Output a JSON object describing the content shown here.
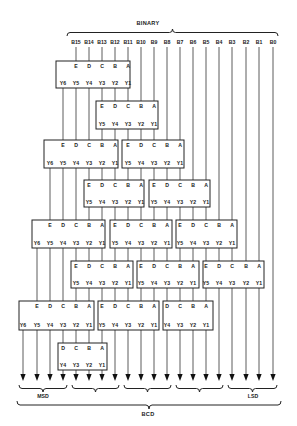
{
  "title": "BINARY",
  "bottom_title": "BCD",
  "msd_label": "MSD",
  "lsd_label": "LSD",
  "columns": [
    23,
    37,
    50,
    63,
    76,
    89,
    102,
    115,
    128,
    141,
    154,
    167,
    180,
    193,
    206,
    219,
    232,
    246,
    259,
    273
  ],
  "binary_bits": [
    {
      "label": "B15",
      "col": 4
    },
    {
      "label": "B14",
      "col": 5
    },
    {
      "label": "B13",
      "col": 6
    },
    {
      "label": "B12",
      "col": 7
    },
    {
      "label": "B11",
      "col": 8
    },
    {
      "label": "B10",
      "col": 9
    },
    {
      "label": "B9",
      "col": 10
    },
    {
      "label": "B8",
      "col": 11
    },
    {
      "label": "B7",
      "col": 12
    },
    {
      "label": "B6",
      "col": 13
    },
    {
      "label": "B5",
      "col": 14
    },
    {
      "label": "B4",
      "col": 15
    },
    {
      "label": "B3",
      "col": 16
    },
    {
      "label": "B2",
      "col": 17
    },
    {
      "label": "B1",
      "col": 18
    },
    {
      "label": "B0",
      "col": 19
    }
  ],
  "boxes": [
    {
      "id": "b1",
      "x": 56,
      "y": 61,
      "w": 74,
      "h": 27,
      "inputs": [
        "E",
        "D",
        "C",
        "B",
        "A"
      ],
      "in_col": 4,
      "outputs": [
        "Y6",
        "Y5",
        "Y4",
        "Y3",
        "Y2",
        "Y1"
      ],
      "out_col": 3
    },
    {
      "id": "b2",
      "x": 96,
      "y": 101,
      "w": 62,
      "h": 28,
      "inputs": [
        "E",
        "D",
        "C",
        "B",
        "A"
      ],
      "in_col": 6,
      "outputs": [
        "Y5",
        "Y4",
        "Y3",
        "Y2",
        "Y1"
      ],
      "out_col": 6
    },
    {
      "id": "b3",
      "x": 44,
      "y": 140,
      "w": 74,
      "h": 28,
      "inputs": [
        "E",
        "D",
        "C",
        "B",
        "A"
      ],
      "in_col": 3,
      "outputs": [
        "Y6",
        "Y5",
        "Y4",
        "Y3",
        "Y2",
        "Y1"
      ],
      "out_col": 2
    },
    {
      "id": "b4",
      "x": 122,
      "y": 140,
      "w": 62,
      "h": 28,
      "inputs": [
        "E",
        "D",
        "C",
        "B",
        "A"
      ],
      "in_col": 8,
      "outputs": [
        "Y5",
        "Y4",
        "Y3",
        "Y2",
        "Y1"
      ],
      "out_col": 8
    },
    {
      "id": "b5",
      "x": 84,
      "y": 180,
      "w": 60,
      "h": 27,
      "inputs": [
        "E",
        "D",
        "C",
        "B",
        "A"
      ],
      "in_col": 5,
      "outputs": [
        "Y5",
        "Y4",
        "Y3",
        "Y2",
        "Y1"
      ],
      "out_col": 5
    },
    {
      "id": "b6",
      "x": 149,
      "y": 180,
      "w": 61,
      "h": 27,
      "inputs": [
        "E",
        "D",
        "C",
        "B",
        "A"
      ],
      "in_col": 10,
      "outputs": [
        "Y5",
        "Y4",
        "Y3",
        "Y2",
        "Y1"
      ],
      "out_col": 10
    },
    {
      "id": "b7",
      "x": 32,
      "y": 220,
      "w": 73,
      "h": 28,
      "inputs": [
        "E",
        "D",
        "C",
        "B",
        "A"
      ],
      "in_col": 2,
      "outputs": [
        "Y6",
        "Y5",
        "Y4",
        "Y3",
        "Y2",
        "Y1"
      ],
      "out_col": 1
    },
    {
      "id": "b8",
      "x": 110,
      "y": 220,
      "w": 62,
      "h": 28,
      "inputs": [
        "E",
        "D",
        "C",
        "B",
        "A"
      ],
      "in_col": 7,
      "outputs": [
        "Y5",
        "Y4",
        "Y3",
        "Y2",
        "Y1"
      ],
      "out_col": 7
    },
    {
      "id": "b9",
      "x": 176,
      "y": 220,
      "w": 61,
      "h": 28,
      "inputs": [
        "E",
        "D",
        "C",
        "B",
        "A"
      ],
      "in_col": 12,
      "outputs": [
        "Y5",
        "Y4",
        "Y3",
        "Y2",
        "Y1"
      ],
      "out_col": 12
    },
    {
      "id": "b10",
      "x": 71,
      "y": 261,
      "w": 62,
      "h": 27,
      "inputs": [
        "E",
        "D",
        "C",
        "B",
        "A"
      ],
      "in_col": 4,
      "outputs": [
        "Y5",
        "Y4",
        "Y3",
        "Y2",
        "Y1"
      ],
      "out_col": 4
    },
    {
      "id": "b11",
      "x": 137,
      "y": 261,
      "w": 62,
      "h": 27,
      "inputs": [
        "E",
        "D",
        "C",
        "B",
        "A"
      ],
      "in_col": 9,
      "outputs": [
        "Y5",
        "Y4",
        "Y3",
        "Y2",
        "Y1"
      ],
      "out_col": 9
    },
    {
      "id": "b12",
      "x": 203,
      "y": 261,
      "w": 61,
      "h": 27,
      "inputs": [
        "E",
        "D",
        "C",
        "B",
        "A"
      ],
      "in_col": 14,
      "outputs": [
        "Y5",
        "Y4",
        "Y3",
        "Y2",
        "Y1"
      ],
      "out_col": 14
    },
    {
      "id": "b13",
      "x": 19,
      "y": 301,
      "w": 75,
      "h": 29,
      "inputs": [
        "E",
        "D",
        "C",
        "B",
        "A"
      ],
      "in_col": 1,
      "outputs": [
        "Y6",
        "Y5",
        "Y4",
        "Y3",
        "Y2",
        "Y1"
      ],
      "out_col": 0
    },
    {
      "id": "b14",
      "x": 98,
      "y": 301,
      "w": 61,
      "h": 29,
      "inputs": [
        "E",
        "D",
        "C",
        "B",
        "A"
      ],
      "in_col": 6,
      "outputs": [
        "Y5",
        "Y4",
        "Y3",
        "Y2",
        "Y1"
      ],
      "out_col": 6
    },
    {
      "id": "b15",
      "x": 163,
      "y": 301,
      "w": 50,
      "h": 29,
      "inputs": [
        "D",
        "C",
        "B",
        "A"
      ],
      "in_col": 11,
      "outputs": [
        "Y4",
        "Y3",
        "Y2",
        "Y1"
      ],
      "out_col": 11
    },
    {
      "id": "b16",
      "x": 58,
      "y": 343,
      "w": 49,
      "h": 27,
      "inputs": [
        "D",
        "C",
        "B",
        "A"
      ],
      "in_col": 3,
      "outputs": [
        "Y4",
        "Y3",
        "Y2",
        "Y1"
      ],
      "out_col": 3
    }
  ],
  "wires": [
    [
      0,
      330,
      375
    ],
    [
      1,
      248,
      301
    ],
    [
      1,
      330,
      375
    ],
    [
      2,
      168,
      220
    ],
    [
      2,
      248,
      301
    ],
    [
      2,
      330,
      375
    ],
    [
      3,
      88,
      140
    ],
    [
      3,
      168,
      220
    ],
    [
      3,
      248,
      301
    ],
    [
      3,
      330,
      343
    ],
    [
      3,
      370,
      375
    ],
    [
      4,
      47,
      61
    ],
    [
      4,
      88,
      140
    ],
    [
      4,
      168,
      220
    ],
    [
      4,
      248,
      261
    ],
    [
      4,
      288,
      301
    ],
    [
      4,
      330,
      343
    ],
    [
      4,
      370,
      375
    ],
    [
      5,
      47,
      61
    ],
    [
      5,
      88,
      140
    ],
    [
      5,
      168,
      180
    ],
    [
      5,
      207,
      220
    ],
    [
      5,
      248,
      261
    ],
    [
      5,
      288,
      301
    ],
    [
      5,
      330,
      343
    ],
    [
      5,
      370,
      375
    ],
    [
      6,
      47,
      61
    ],
    [
      6,
      88,
      101
    ],
    [
      6,
      129,
      140
    ],
    [
      6,
      168,
      180
    ],
    [
      6,
      207,
      220
    ],
    [
      6,
      248,
      261
    ],
    [
      6,
      288,
      301
    ],
    [
      6,
      330,
      343
    ],
    [
      6,
      370,
      375
    ],
    [
      7,
      47,
      61
    ],
    [
      7,
      88,
      101
    ],
    [
      7,
      129,
      140
    ],
    [
      7,
      168,
      180
    ],
    [
      7,
      207,
      220
    ],
    [
      7,
      248,
      261
    ],
    [
      7,
      288,
      301
    ],
    [
      7,
      330,
      375
    ],
    [
      8,
      47,
      61
    ],
    [
      8,
      88,
      101
    ],
    [
      8,
      129,
      140
    ],
    [
      8,
      168,
      180
    ],
    [
      8,
      207,
      220
    ],
    [
      8,
      248,
      261
    ],
    [
      8,
      288,
      301
    ],
    [
      8,
      330,
      375
    ],
    [
      9,
      47,
      101
    ],
    [
      9,
      129,
      140
    ],
    [
      9,
      168,
      180
    ],
    [
      9,
      207,
      220
    ],
    [
      9,
      248,
      261
    ],
    [
      9,
      288,
      301
    ],
    [
      9,
      330,
      375
    ],
    [
      10,
      47,
      101
    ],
    [
      10,
      129,
      140
    ],
    [
      10,
      168,
      180
    ],
    [
      10,
      207,
      220
    ],
    [
      10,
      248,
      261
    ],
    [
      10,
      288,
      301
    ],
    [
      10,
      330,
      375
    ],
    [
      11,
      47,
      140
    ],
    [
      11,
      168,
      180
    ],
    [
      11,
      207,
      220
    ],
    [
      11,
      248,
      261
    ],
    [
      11,
      288,
      301
    ],
    [
      11,
      330,
      375
    ],
    [
      12,
      47,
      140
    ],
    [
      12,
      168,
      180
    ],
    [
      12,
      207,
      220
    ],
    [
      12,
      248,
      261
    ],
    [
      12,
      288,
      301
    ],
    [
      12,
      330,
      375
    ],
    [
      13,
      47,
      180
    ],
    [
      13,
      207,
      220
    ],
    [
      13,
      248,
      261
    ],
    [
      13,
      288,
      301
    ],
    [
      13,
      330,
      375
    ],
    [
      14,
      47,
      180
    ],
    [
      14,
      207,
      220
    ],
    [
      14,
      248,
      261
    ],
    [
      14,
      288,
      301
    ],
    [
      14,
      330,
      375
    ],
    [
      15,
      47,
      220
    ],
    [
      15,
      248,
      261
    ],
    [
      15,
      288,
      375
    ],
    [
      16,
      47,
      220
    ],
    [
      16,
      248,
      261
    ],
    [
      16,
      288,
      375
    ],
    [
      17,
      47,
      261
    ],
    [
      17,
      288,
      375
    ],
    [
      18,
      47,
      261
    ],
    [
      18,
      288,
      375
    ],
    [
      19,
      47,
      375
    ]
  ],
  "digit_groups": [
    {
      "from": 0,
      "to": 3
    },
    {
      "from": 4,
      "to": 7
    },
    {
      "from": 8,
      "to": 11
    },
    {
      "from": 12,
      "to": 15
    },
    {
      "from": 16,
      "to": 19
    }
  ]
}
